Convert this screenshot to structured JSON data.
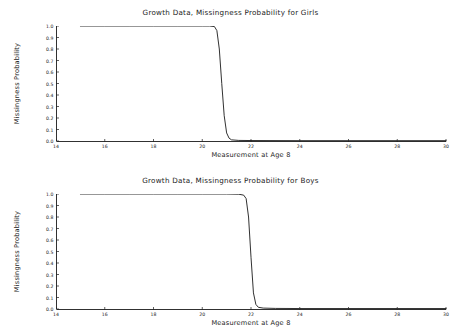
{
  "figures": [
    {
      "id": "girls",
      "title": "Growth Data, Missingness Probability for Girls",
      "ylabel": "Missingness Probability",
      "xlabel": "Measurement at Age 8"
    },
    {
      "id": "boys",
      "title": "Growth Data, Missingness Probability for Boys",
      "ylabel": "Missingness Probability",
      "xlabel": "Measurement at Age 8"
    }
  ],
  "chart_data": [
    {
      "type": "line",
      "title": "Growth Data, Missingness Probability for Girls",
      "xlabel": "Measurement at Age 8",
      "ylabel": "Missingness Probability",
      "xlim": [
        14,
        30
      ],
      "ylim": [
        0.0,
        1.0
      ],
      "grid": false,
      "legend": "none",
      "xticks": [
        14,
        16,
        18,
        20,
        22,
        24,
        26,
        28,
        30
      ],
      "xtick_labels": [
        "14",
        "16",
        "18",
        "20",
        "22",
        "24",
        "26",
        "28",
        "30"
      ],
      "yticks": [
        0.0,
        0.1,
        0.2,
        0.3,
        0.4,
        0.5,
        0.6,
        0.7,
        0.8,
        0.9,
        1.0
      ],
      "ytick_labels": [
        "0.0",
        "0.1",
        "0.2",
        "0.3",
        "0.4",
        "0.5",
        "0.6",
        "0.7",
        "0.8",
        "0.9",
        "1.0"
      ],
      "line_color": "#1a1a1a",
      "series": [
        {
          "name": "missingness probability",
          "x": [
            15.0,
            16.0,
            17.0,
            18.0,
            19.0,
            20.0,
            20.3,
            20.5,
            20.6,
            20.7,
            20.8,
            20.9,
            21.0,
            21.1,
            21.2,
            21.5,
            22.0,
            24.0,
            26.0,
            28.0,
            30.0
          ],
          "y": [
            1.0,
            1.0,
            1.0,
            1.0,
            1.0,
            1.0,
            1.0,
            0.995,
            0.96,
            0.8,
            0.5,
            0.22,
            0.07,
            0.025,
            0.01,
            0.005,
            0.004,
            0.003,
            0.003,
            0.003,
            0.003
          ]
        }
      ]
    },
    {
      "type": "line",
      "title": "Growth Data, Missingness Probability for Boys",
      "xlabel": "Measurement at Age 8",
      "ylabel": "Missingness Probability",
      "xlim": [
        14,
        30
      ],
      "ylim": [
        0.0,
        1.0
      ],
      "grid": false,
      "legend": "none",
      "xticks": [
        14,
        16,
        18,
        20,
        22,
        24,
        26,
        28,
        30
      ],
      "xtick_labels": [
        "14",
        "16",
        "18",
        "20",
        "22",
        "24",
        "26",
        "28",
        "30"
      ],
      "yticks": [
        0.0,
        0.1,
        0.2,
        0.3,
        0.4,
        0.5,
        0.6,
        0.7,
        0.8,
        0.9,
        1.0
      ],
      "ytick_labels": [
        "0.0",
        "0.1",
        "0.2",
        "0.3",
        "0.4",
        "0.5",
        "0.6",
        "0.7",
        "0.8",
        "0.9",
        "1.0"
      ],
      "line_color": "#1a1a1a",
      "series": [
        {
          "name": "missingness probability",
          "x": [
            15.0,
            16.0,
            17.0,
            18.0,
            19.0,
            20.0,
            21.0,
            21.5,
            21.7,
            21.8,
            21.9,
            22.0,
            22.1,
            22.2,
            22.3,
            22.5,
            23.0,
            24.0,
            26.0,
            28.0,
            30.0
          ],
          "y": [
            1.0,
            1.0,
            1.0,
            1.0,
            1.0,
            1.0,
            1.0,
            0.998,
            0.99,
            0.96,
            0.8,
            0.45,
            0.14,
            0.04,
            0.015,
            0.008,
            0.005,
            0.004,
            0.004,
            0.004,
            0.004
          ]
        }
      ]
    }
  ]
}
